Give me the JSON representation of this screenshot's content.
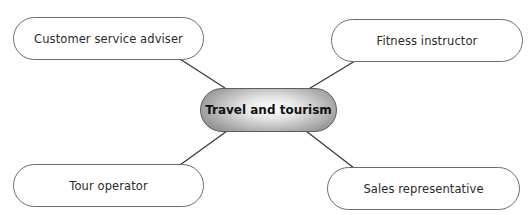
{
  "diagram": {
    "type": "mind-map",
    "central_topic": "Travel and tourism",
    "branches": [
      {
        "position": "top-left",
        "label": "Customer service adviser"
      },
      {
        "position": "top-right",
        "label": "Fitness instructor"
      },
      {
        "position": "bottom-left",
        "label": "Tour operator"
      },
      {
        "position": "bottom-right",
        "label": "Sales representative"
      }
    ],
    "colors": {
      "connector": "#3a3a3a",
      "node_border": "#6b6b6b",
      "center_gradient_light": "#ffffff",
      "center_gradient_dark": "#8c8c8c"
    }
  }
}
